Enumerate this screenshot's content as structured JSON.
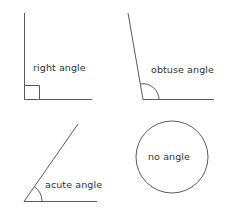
{
  "figure": {
    "background_color": "#ffffff",
    "line_color": "#5a5a5a",
    "text_color": "#2f2f2f",
    "width": 229,
    "height": 222
  },
  "panels": [
    {
      "id": "right-angle",
      "label": "right angle",
      "marker": "square",
      "vertex": [
        24,
        99
      ],
      "rays": [
        [
          24,
          13
        ],
        [
          92,
          99
        ]
      ],
      "angle_degrees": 90
    },
    {
      "id": "obtuse-angle",
      "label": "obtuse angle",
      "marker": "arc",
      "vertex": [
        143,
        99
      ],
      "rays": [
        [
          128,
          13
        ],
        [
          214,
          99
        ]
      ],
      "angle_degrees": 100
    },
    {
      "id": "acute-angle",
      "label": "acute angle",
      "marker": "arc",
      "vertex": [
        24,
        201
      ],
      "rays": [
        [
          78,
          124
        ],
        [
          97,
          201
        ]
      ],
      "angle_degrees": 55
    },
    {
      "id": "no-angle",
      "label": "no angle",
      "marker": "circle",
      "center": [
        172,
        157
      ],
      "radius": 36,
      "angle_degrees": null
    }
  ],
  "labels": {
    "right_angle": "right angle",
    "obtuse_angle": "obtuse angle",
    "acute_angle": "acute angle",
    "no_angle": "no angle"
  }
}
